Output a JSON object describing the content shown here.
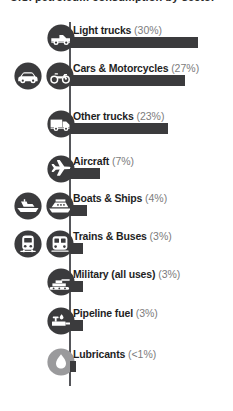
{
  "title_remnant": "U.S. petroleum consumption by sector",
  "colors": {
    "bar": "#3b3b3d",
    "axis": "#55565a",
    "icon_dark": "#3b3b3d",
    "icon_light": "#9a9a9c",
    "label": "#1f1f1f",
    "percent": "#7c7c7c",
    "background": "#ffffff"
  },
  "chart_data": {
    "type": "bar",
    "orientation": "horizontal",
    "title": "",
    "xlabel": "",
    "ylabel": "",
    "grid": false,
    "legend": false,
    "xlim": [
      0,
      30
    ],
    "categories": [
      "Light trucks",
      "Cars & Motorcycles",
      "Other trucks",
      "Aircraft",
      "Boats & Ships",
      "Trains & Buses",
      "Military (all uses)",
      "Pipeline fuel",
      "Lubricants"
    ],
    "values": [
      30,
      27,
      23,
      7,
      4,
      3,
      3,
      3,
      0.5
    ],
    "value_labels": [
      "(30%)",
      "(27%)",
      "(23%)",
      "(7%)",
      "(4%)",
      "(3%)",
      "(3%)",
      "(3%)",
      "(<1%)"
    ]
  },
  "rows": [
    {
      "label": "Light trucks",
      "pct": "(30%)",
      "value": 30,
      "icons": [
        "pickup-truck-icon"
      ]
    },
    {
      "label": "Cars & Motorcycles",
      "pct": "(27%)",
      "value": 27,
      "icons": [
        "car-icon",
        "motorcycle-icon"
      ]
    },
    {
      "label": "Other trucks",
      "pct": "(23%)",
      "value": 23,
      "icons": [
        "box-truck-icon"
      ]
    },
    {
      "label": "Aircraft",
      "pct": "(7%)",
      "value": 7,
      "icons": [
        "airplane-icon"
      ]
    },
    {
      "label": "Boats & Ships",
      "pct": "(4%)",
      "value": 4,
      "icons": [
        "speedboat-icon",
        "cruise-ship-icon"
      ]
    },
    {
      "label": "Trains & Buses",
      "pct": "(3%)",
      "value": 3,
      "icons": [
        "train-icon",
        "bus-icon"
      ]
    },
    {
      "label": "Military (all uses)",
      "pct": "(3%)",
      "value": 3,
      "icons": [
        "tank-icon"
      ]
    },
    {
      "label": "Pipeline fuel",
      "pct": "(3%)",
      "value": 3,
      "icons": [
        "pipeline-icon"
      ]
    },
    {
      "label": "Lubricants",
      "pct": "(<1%)",
      "value": 0.5,
      "icons": [
        "oil-drop-icon"
      ]
    }
  ]
}
